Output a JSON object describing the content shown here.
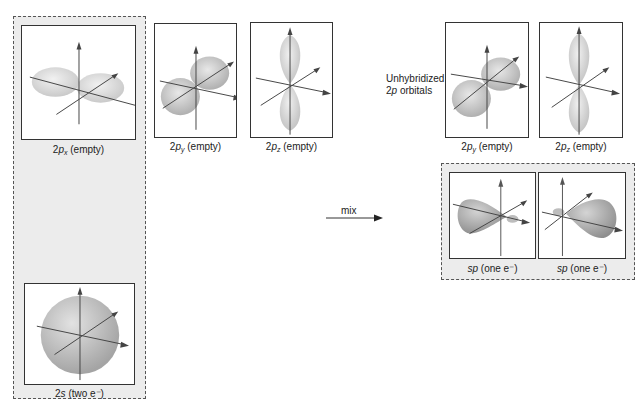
{
  "diagram": {
    "left_group": {
      "orbitals": [
        {
          "id": "2px",
          "prefix": "2",
          "letter": "p",
          "subscript": "x",
          "suffix": " (empty)",
          "shape": "p-horizontal"
        },
        {
          "id": "2s",
          "prefix": "2",
          "letter": "s",
          "subscript": "",
          "suffix": " (two e⁻)",
          "shape": "sphere"
        }
      ]
    },
    "middle_orbitals": [
      {
        "id": "2py",
        "prefix": "2",
        "letter": "p",
        "subscript": "y",
        "suffix": " (empty)",
        "shape": "p-diagonal"
      },
      {
        "id": "2pz",
        "prefix": "2",
        "letter": "p",
        "subscript": "z",
        "suffix": " (empty)",
        "shape": "p-vertical"
      }
    ],
    "mix": {
      "label": "mix"
    },
    "unhybridized": {
      "label_line1": "Unhybridized",
      "label_line2_prefix": "2",
      "label_line2_italic": "p",
      "label_line2_suffix": " orbitals",
      "orbitals": [
        {
          "id": "2py-right",
          "prefix": "2",
          "letter": "p",
          "subscript": "y",
          "suffix": " (empty)",
          "shape": "p-diagonal"
        },
        {
          "id": "2pz-right",
          "prefix": "2",
          "letter": "p",
          "subscript": "z",
          "suffix": " (empty)",
          "shape": "p-vertical"
        }
      ]
    },
    "hybrid_group": {
      "orbitals": [
        {
          "id": "sp1",
          "italic": "sp",
          "suffix": " (one e⁻)",
          "shape": "sp-left"
        },
        {
          "id": "sp2",
          "italic": "sp",
          "suffix": " (one e⁻)",
          "shape": "sp-right"
        }
      ]
    },
    "colors": {
      "group_fill": "#ececec",
      "lobe_fill": "#d8d8d8",
      "lobe_dark": "#a8a8a8",
      "axis": "#444444",
      "panel_border": "#333333"
    }
  }
}
